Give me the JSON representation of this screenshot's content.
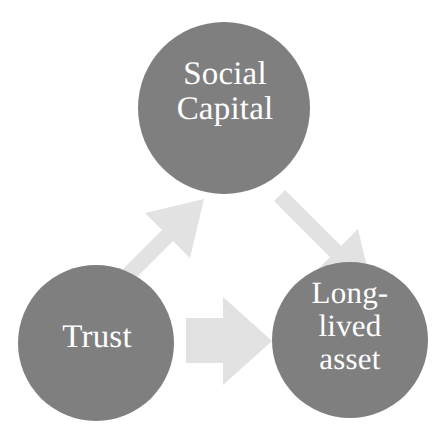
{
  "diagram": {
    "type": "cycle-diagram",
    "background_color": "#ffffff",
    "node_fill_color": "#7f7f7f",
    "node_text_color": "#ffffff",
    "arrow_fill_color": "#e2e2e2",
    "nodes": [
      {
        "id": "social-capital",
        "label": "Social\nCapital",
        "shape": "circle",
        "cx": 224,
        "cy": 108,
        "r": 86
      },
      {
        "id": "trust",
        "label": "Trust",
        "shape": "circle",
        "cx": 96,
        "cy": 343,
        "r": 78
      },
      {
        "id": "long-lived-asset",
        "label": "Long-\nlived\nasset",
        "shape": "circle",
        "cx": 350,
        "cy": 340,
        "r": 78
      }
    ],
    "arrows": [
      {
        "id": "trust-to-social-capital",
        "from": "trust",
        "to": "social-capital",
        "direction": "up-right"
      },
      {
        "id": "social-capital-to-long-lived-asset",
        "from": "social-capital",
        "to": "long-lived-asset",
        "direction": "down-right"
      },
      {
        "id": "trust-to-long-lived-asset",
        "from": "trust",
        "to": "long-lived-asset",
        "direction": "right"
      }
    ]
  }
}
